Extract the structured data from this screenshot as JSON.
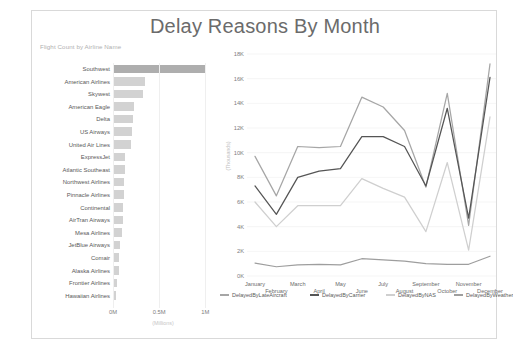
{
  "report": {
    "title": "Delay Reasons By Month"
  },
  "bar_chart": {
    "title": "Flight Count by Airline Name",
    "axis_caption": "(Millions)",
    "ticks": [
      "0M",
      "0.5M",
      "1M"
    ],
    "tick_values": [
      0,
      0.5,
      1
    ],
    "highlight_color": "#aeaeae",
    "bar_color": "#d2d2d2"
  },
  "line_chart": {
    "ylabel": "(Thousands)",
    "y_ticks": [
      "0K",
      "2K",
      "4K",
      "6K",
      "8K",
      "10K",
      "12K",
      "14K",
      "16K",
      "18K"
    ]
  },
  "legend": {
    "items": [
      {
        "label": "DelayedByLateAircraft",
        "color": "#a6a6a6"
      },
      {
        "label": "DelayedByCarrier",
        "color": "#555555"
      },
      {
        "label": "DelayedByNAS",
        "color": "#cfcfcf"
      },
      {
        "label": "DelayedByWeather",
        "color": "#9e9e9e"
      }
    ]
  },
  "chart_data": [
    {
      "type": "bar",
      "title": "Flight Count by Airline Name",
      "xlabel": "(Millions)",
      "ylabel": "",
      "orientation": "horizontal",
      "xlim": [
        0,
        1.05
      ],
      "grid": true,
      "categories": [
        "Southwest",
        "American Airlines",
        "Skywest",
        "American Eagle",
        "Delta",
        "US Airways",
        "United Air Lines",
        "ExpressJet",
        "Atlantic Southeast",
        "Northwest Airlines",
        "Pinnacle Airlines",
        "Continental",
        "AirTran Airways",
        "Mesa Airlines",
        "JetBlue Airways",
        "Comair",
        "Alaska Airlines",
        "Frontier Airlines",
        "Hawaiian Airlines"
      ],
      "values": [
        1.0,
        0.345,
        0.33,
        0.23,
        0.215,
        0.205,
        0.195,
        0.13,
        0.125,
        0.12,
        0.115,
        0.11,
        0.105,
        0.1,
        0.08,
        0.07,
        0.062,
        0.038,
        0.032
      ],
      "value_unit": "Millions"
    },
    {
      "type": "line",
      "title": "Delay Reasons By Month",
      "xlabel": "",
      "ylabel": "(Thousands)",
      "ylim": [
        0,
        18000
      ],
      "ytick_values": [
        0,
        2000,
        4000,
        6000,
        8000,
        10000,
        12000,
        14000,
        16000,
        18000
      ],
      "grid": true,
      "legend_position": "bottom",
      "categories": [
        "January",
        "February",
        "March",
        "April",
        "May",
        "June",
        "July",
        "August",
        "September",
        "October",
        "November",
        "December"
      ],
      "series": [
        {
          "name": "DelayedByLateAircraft",
          "color": "#a6a6a6",
          "values": [
            9700,
            6500,
            10500,
            10400,
            10500,
            14500,
            13700,
            11800,
            7200,
            14800,
            4100,
            17200
          ]
        },
        {
          "name": "DelayedByCarrier",
          "color": "#555555",
          "values": [
            7300,
            5000,
            8000,
            8500,
            8700,
            11300,
            11300,
            10500,
            7300,
            13600,
            4700,
            16100
          ]
        },
        {
          "name": "DelayedByNAS",
          "color": "#cfcfcf",
          "values": [
            6000,
            4000,
            5700,
            5700,
            5700,
            7900,
            7100,
            6400,
            3600,
            9200,
            2100,
            12900
          ]
        },
        {
          "name": "DelayedByWeather",
          "color": "#9e9e9e",
          "values": [
            1050,
            750,
            900,
            950,
            900,
            1400,
            1300,
            1200,
            1000,
            950,
            950,
            1600
          ]
        }
      ]
    }
  ]
}
